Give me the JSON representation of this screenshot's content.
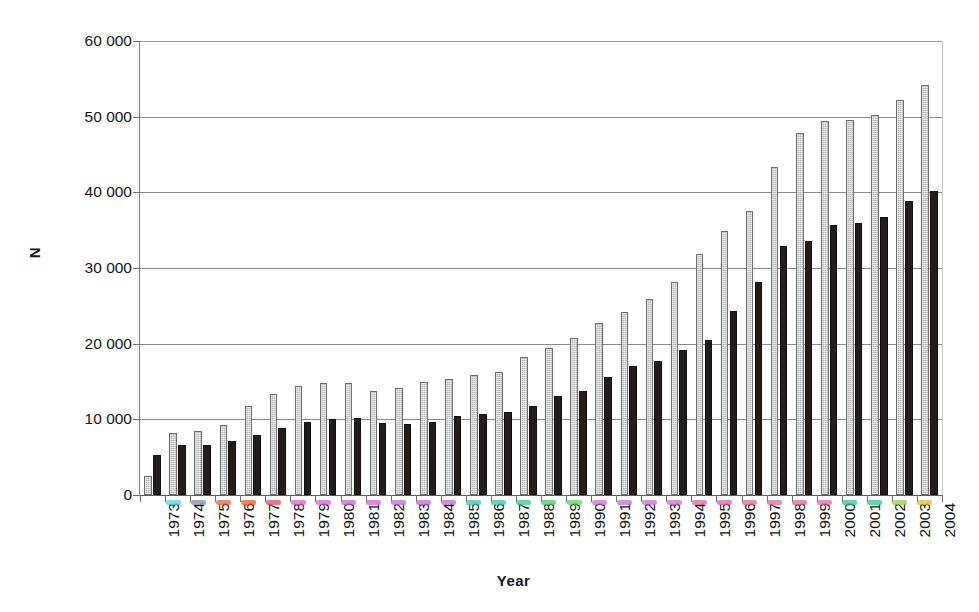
{
  "chart_data": {
    "type": "bar",
    "title": "",
    "xlabel": "Year",
    "ylabel": "N",
    "ylim": [
      0,
      60000
    ],
    "ytick_values": [
      0,
      10000,
      20000,
      30000,
      40000,
      50000,
      60000
    ],
    "ytick_labels": [
      "0",
      "10 000",
      "20 000",
      "30 000",
      "40 000",
      "50 000",
      "60 000"
    ],
    "grid": true,
    "legend": "none",
    "categories": [
      "1973",
      "1974",
      "1975",
      "1976",
      "1977",
      "1978",
      "1979",
      "1980",
      "1981",
      "1982",
      "1983",
      "1984",
      "1985",
      "1986",
      "1987",
      "1988",
      "1989",
      "1990",
      "1991",
      "1992",
      "1993",
      "1994",
      "1995",
      "1996",
      "1997",
      "1998",
      "1999",
      "2000",
      "2001",
      "2002",
      "2003",
      "2004"
    ],
    "series": [
      {
        "name": "series-gray",
        "color": "#b4b4b4",
        "values": [
          2500,
          8200,
          8400,
          9300,
          11700,
          13400,
          14400,
          14800,
          14800,
          13700,
          14100,
          15000,
          15300,
          15800,
          16200,
          18300,
          19400,
          20800,
          22700,
          24200,
          25900,
          28200,
          31900,
          34900,
          37500,
          43400,
          47800,
          49400,
          49600,
          50200,
          52200,
          54200
        ]
      },
      {
        "name": "series-black",
        "color": "#241d1a",
        "values": [
          5300,
          6600,
          6600,
          7200,
          7900,
          8800,
          9600,
          10100,
          10200,
          9500,
          9400,
          9600,
          10400,
          10700,
          11000,
          11700,
          13100,
          13800,
          15600,
          17000,
          17700,
          19100,
          20500,
          24300,
          28200,
          32900,
          33600,
          35700,
          35900,
          36800,
          38800,
          40200
        ]
      }
    ],
    "year_fringe_colors": [
      "#55d3d6",
      "#8a8f9c",
      "#e8613a",
      "#e85a2e",
      "#e34a5c",
      "#e062c4",
      "#cf63d4",
      "#c566d8",
      "#c965d4",
      "#c966d2",
      "#c469cf",
      "#c06bcd",
      "#46b9b2",
      "#38c7a6",
      "#38c78f",
      "#4bcb6e",
      "#57cf62",
      "#c96fd0",
      "#c76fd0",
      "#c86dce",
      "#cf6bc9",
      "#d2699f",
      "#d7669a",
      "#d96a93",
      "#db6790",
      "#d86a96",
      "#d869b0",
      "#2fc98a",
      "#2fc98a",
      "#9bc940",
      "#d4c034",
      "#ffffff"
    ]
  }
}
